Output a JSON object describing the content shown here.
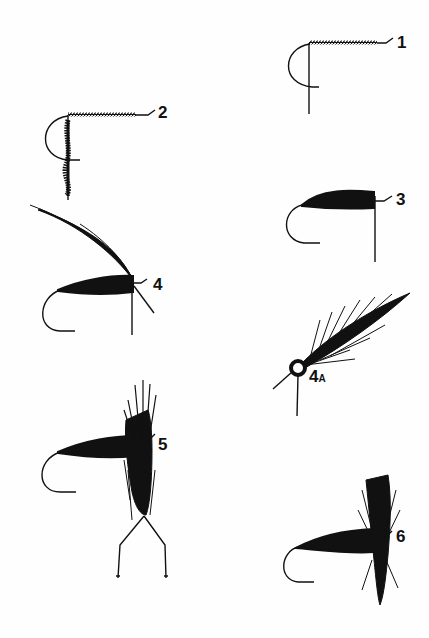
{
  "diagram": {
    "ink_color": "#111111",
    "background": "#fefefe",
    "steps": [
      {
        "id": "1",
        "label": "1",
        "description": "Bare hook with thread wrapped along shank"
      },
      {
        "id": "2",
        "label": "2",
        "description": "Thread-wrapped shank with dubbing strand hanging"
      },
      {
        "id": "3",
        "label": "3",
        "description": "Dubbed body wound on hook"
      },
      {
        "id": "4",
        "label": "4",
        "description": "Body with hackle feather tied in at head"
      },
      {
        "id": "4A",
        "label": "4",
        "sub": "A",
        "description": "Detail of hackle feather tied in (front view)"
      },
      {
        "id": "5",
        "label": "5",
        "description": "Hackle being wound with hackle pliers"
      },
      {
        "id": "6",
        "label": "6",
        "description": "Completed dry fly with wound hackle"
      }
    ]
  }
}
